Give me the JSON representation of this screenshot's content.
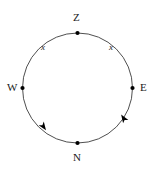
{
  "figure": {
    "type": "circle-diagram",
    "background_color": "#ffffff",
    "stroke_color": "#3b3b3b",
    "marker_color": "#000000",
    "label_color": "#1a1a1a",
    "circle": {
      "center_x": 77.5,
      "center_y": 88,
      "radius": 55,
      "stroke_width": 0.9
    },
    "points": [
      {
        "id": "zenith",
        "label": "Z",
        "x": 77.5,
        "y": 33,
        "label_x": 73,
        "label_y": 12,
        "marker": "filled-dot"
      },
      {
        "id": "east",
        "label": "E",
        "x": 132.5,
        "y": 88,
        "label_x": 140,
        "label_y": 82,
        "marker": "filled-dot"
      },
      {
        "id": "north",
        "label": "N",
        "x": 77.5,
        "y": 143,
        "label_x": 73,
        "label_y": 152,
        "marker": "filled-dot"
      },
      {
        "id": "west",
        "label": "W",
        "x": 22.5,
        "y": 88,
        "label_x": 7,
        "label_y": 82,
        "marker": "filled-dot"
      }
    ],
    "arc_labels": [
      {
        "id": "arc-label-left",
        "text": "x",
        "x": 41,
        "y": 43
      },
      {
        "id": "arc-label-right",
        "text": "x",
        "x": 109,
        "y": 43
      }
    ],
    "arrowheads": [
      {
        "id": "arrow-lower-left",
        "x": 43,
        "y": 126,
        "angle_deg": 55,
        "size": 7
      },
      {
        "id": "arrow-lower-right",
        "x": 124,
        "y": 119,
        "angle_deg": -123,
        "size": 7
      }
    ]
  }
}
